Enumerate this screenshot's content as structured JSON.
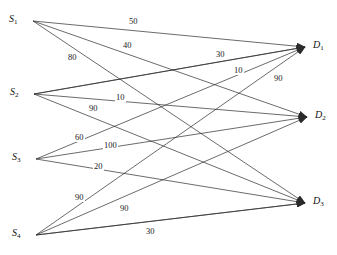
{
  "diagram": {
    "type": "bipartite-transportation-network",
    "title": "",
    "sources": [
      {
        "id": "S1",
        "label": "S",
        "sub": "1",
        "x": 33,
        "y": 21
      },
      {
        "id": "S2",
        "label": "S",
        "sub": "2",
        "x": 34,
        "y": 94
      },
      {
        "id": "S3",
        "label": "S",
        "sub": "3",
        "x": 36,
        "y": 159
      },
      {
        "id": "S4",
        "label": "S",
        "sub": "4",
        "x": 36,
        "y": 235
      }
    ],
    "destinations": [
      {
        "id": "D1",
        "label": "D",
        "sub": "1",
        "x": 305,
        "y": 47
      },
      {
        "id": "D2",
        "label": "D",
        "sub": "2",
        "x": 307,
        "y": 117
      },
      {
        "id": "D3",
        "label": "D",
        "sub": "3",
        "x": 305,
        "y": 203
      }
    ],
    "edges": [
      {
        "from": "S1",
        "to": "D1",
        "weight": "50",
        "lx": 128,
        "ly": 17
      },
      {
        "from": "S1",
        "to": "D2",
        "weight": "40",
        "lx": 122,
        "ly": 41
      },
      {
        "from": "S1",
        "to": "D3",
        "weight": "80",
        "lx": 67,
        "ly": 53
      },
      {
        "from": "S2",
        "to": "D1",
        "weight": "30",
        "lx": 215,
        "ly": 50
      },
      {
        "from": "S2",
        "to": "D2",
        "weight": "10",
        "lx": 115,
        "ly": 93
      },
      {
        "from": "S2",
        "to": "D3",
        "weight": "90",
        "lx": 88,
        "ly": 104
      },
      {
        "from": "S3",
        "to": "D1",
        "weight": "10",
        "lx": 233,
        "ly": 66
      },
      {
        "from": "S3",
        "to": "D2",
        "weight": "60",
        "lx": 74,
        "ly": 133
      },
      {
        "from": "S3",
        "to": "D3",
        "weight": "100",
        "lx": 103,
        "ly": 141
      },
      {
        "from": "S4",
        "to": "D1",
        "weight": "20",
        "lx": 93,
        "ly": 162
      },
      {
        "from": "S4",
        "to": "D2",
        "weight": "90",
        "lx": 74,
        "ly": 193
      },
      {
        "from": "S4",
        "to": "D3",
        "weight": "90",
        "lx": 119,
        "ly": 204
      },
      {
        "from": "S4",
        "to": "D3b",
        "weight": "30",
        "lx": 145,
        "ly": 227
      },
      {
        "from": "S2",
        "to": "D1b",
        "weight": "90",
        "lx": 273,
        "ly": 74
      }
    ],
    "style": {
      "edge_color": "#2b2b2b",
      "background": "#ffffff",
      "label_color": "#1a1a1a"
    }
  }
}
